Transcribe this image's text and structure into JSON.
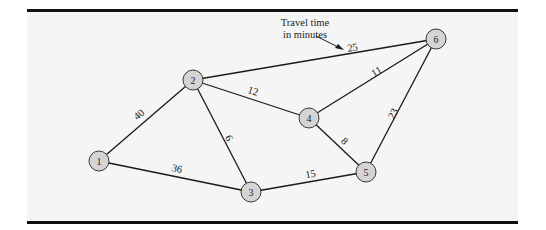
{
  "diagram": {
    "type": "weighted-undirected-graph",
    "annotation": {
      "line1": "Travel time",
      "line2": "in minutes",
      "points_to_edge": "2-6"
    },
    "nodes": [
      {
        "id": "1",
        "label": "1"
      },
      {
        "id": "2",
        "label": "2"
      },
      {
        "id": "3",
        "label": "3"
      },
      {
        "id": "4",
        "label": "4"
      },
      {
        "id": "5",
        "label": "5"
      },
      {
        "id": "6",
        "label": "6"
      }
    ],
    "edges": [
      {
        "from": "1",
        "to": "2",
        "weight": "40"
      },
      {
        "from": "1",
        "to": "3",
        "weight": "36"
      },
      {
        "from": "2",
        "to": "3",
        "weight": "6"
      },
      {
        "from": "2",
        "to": "4",
        "weight": "12"
      },
      {
        "from": "2",
        "to": "6",
        "weight": "25"
      },
      {
        "from": "3",
        "to": "5",
        "weight": "15"
      },
      {
        "from": "4",
        "to": "5",
        "weight": "8"
      },
      {
        "from": "4",
        "to": "6",
        "weight": "11"
      },
      {
        "from": "5",
        "to": "6",
        "weight": "23"
      }
    ]
  },
  "colors": {
    "node_fill": "#d4d4d4",
    "panel_background": "#f5f5f5",
    "rule": "#111111"
  }
}
